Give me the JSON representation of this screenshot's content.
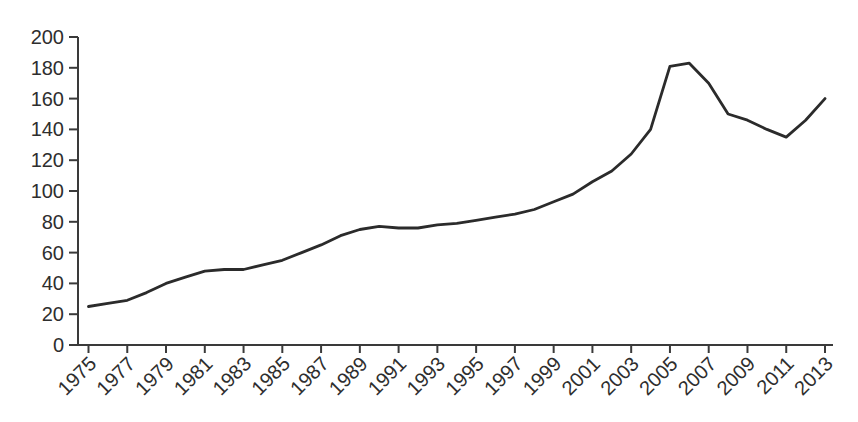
{
  "chart_data": {
    "type": "line",
    "title": "",
    "subtitle": "",
    "xlabel": "",
    "ylabel": "",
    "legend": "none",
    "grid": false,
    "xlim": [
      1975,
      2013
    ],
    "ylim": [
      0,
      200
    ],
    "y_ticks": [
      0,
      20,
      40,
      60,
      80,
      100,
      120,
      140,
      160,
      180,
      200
    ],
    "x_tick_labels": [
      "1975",
      "1977",
      "1979",
      "1981",
      "1983",
      "1985",
      "1987",
      "1989",
      "1991",
      "1993",
      "1995",
      "1997",
      "1999",
      "2001",
      "2003",
      "2005",
      "2007",
      "2009",
      "2011",
      "2013"
    ],
    "x": [
      1975,
      1976,
      1977,
      1978,
      1979,
      1980,
      1981,
      1982,
      1983,
      1984,
      1985,
      1986,
      1987,
      1988,
      1989,
      1990,
      1991,
      1992,
      1993,
      1994,
      1995,
      1996,
      1997,
      1998,
      1999,
      2000,
      2001,
      2002,
      2003,
      2004,
      2005,
      2006,
      2007,
      2008,
      2009,
      2010,
      2011,
      2012,
      2013
    ],
    "values": [
      25,
      27,
      29,
      34,
      40,
      44,
      48,
      49,
      49,
      52,
      55,
      60,
      65,
      71,
      75,
      77,
      76,
      76,
      78,
      79,
      81,
      83,
      85,
      88,
      93,
      98,
      106,
      113,
      124,
      140,
      181,
      183,
      170,
      150,
      146,
      140,
      135,
      146,
      160
    ],
    "colors": {
      "line": "#2b2b2b",
      "axis": "#3a3a3a",
      "tick": "#3a3a3a",
      "label": "#2e2e2e",
      "background": "#ffffff"
    }
  }
}
